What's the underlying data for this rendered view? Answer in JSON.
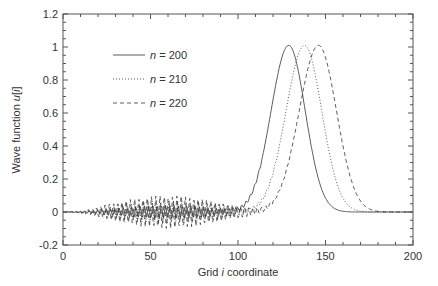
{
  "chart_data": {
    "type": "line",
    "title": "",
    "xlabel": "Grid i coordinate",
    "xlabel_parts": {
      "pre": "Grid ",
      "italic": "i",
      "post": " coordinate"
    },
    "ylabel": "Wave function u[i]",
    "ylabel_parts": {
      "pre": "Wave function ",
      "italic": "u",
      "post": "[",
      "italic2": "i",
      "post2": "]"
    },
    "xlim": [
      0,
      200
    ],
    "ylim": [
      -0.2,
      1.2
    ],
    "xticks": [
      0,
      50,
      100,
      150,
      200
    ],
    "xtick_labels": [
      "0",
      "50",
      "100",
      "150",
      "200"
    ],
    "yticks": [
      -0.2,
      0,
      0.2,
      0.4,
      0.6,
      0.8,
      1,
      1.2
    ],
    "ytick_labels": [
      "-0.2",
      "0",
      "0.2",
      "0.4",
      "0.6",
      "0.8",
      "1",
      "1.2"
    ],
    "grid": false,
    "legend_position": "upper left",
    "series": [
      {
        "name": "n = 200",
        "n_label": "n",
        "n_value": "= 200",
        "style": "solid",
        "peak_x": 129,
        "peak_y": 1.01,
        "width": 11,
        "oscillation_amp": 0.04
      },
      {
        "name": "n = 210",
        "n_label": "n",
        "n_value": "= 210",
        "style": "dotted",
        "peak_x": 138,
        "peak_y": 1.01,
        "width": 11.5,
        "oscillation_amp": 0.07
      },
      {
        "name": "n = 220",
        "n_label": "n",
        "n_value": "= 220",
        "style": "dashed",
        "peak_x": 146,
        "peak_y": 1.01,
        "width": 12,
        "oscillation_amp": 0.1
      }
    ]
  }
}
